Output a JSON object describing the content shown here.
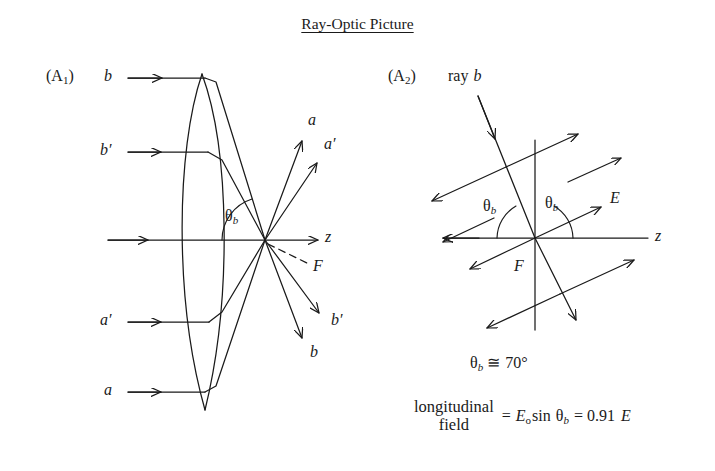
{
  "document": {
    "title": "Ray-Optic Picture",
    "background_color": "#ffffff",
    "ink_color": "#1a1a1a"
  },
  "panels": [
    {
      "tag": "(A",
      "tag_sub": "1",
      "tag_close": ")",
      "name": "lens-ray-diagram",
      "description": "Converging lens with parallel input rays focusing to a point",
      "incoming_rays": [
        {
          "label": "b",
          "y": 78
        },
        {
          "label": "b",
          "prime": "′",
          "y": 152
        },
        {
          "label": "",
          "y": 240
        },
        {
          "label": "a",
          "prime": "′",
          "y": 322
        },
        {
          "label": "a",
          "y": 392
        }
      ],
      "outgoing_rays": [
        {
          "label": "a",
          "direction": "up-right-steep"
        },
        {
          "label": "a′",
          "direction": "up-right-shallow"
        },
        {
          "label": "z",
          "direction": "right-axis"
        },
        {
          "label": "F",
          "direction": "down-right-dashed"
        },
        {
          "label": "b′",
          "direction": "down-right-shallow"
        },
        {
          "label": "b",
          "direction": "down-right-steep"
        }
      ],
      "angle_label": "θ",
      "angle_sub": "b",
      "axis_label": "z",
      "focal_label": "F"
    },
    {
      "tag": "(A",
      "tag_sub": "2",
      "tag_close": ")",
      "name": "field-vector-diagram",
      "description": "Ray b crossing the axis with transverse E field vectors",
      "ray_label_prefix": "ray",
      "ray_label": "b",
      "field_label": "E",
      "axis_label": "z",
      "focal_label": "F",
      "angle_label": "θ",
      "angle_sub": "b",
      "angle_count": 2
    }
  ],
  "captions": {
    "angle_value": {
      "symbol": "θ",
      "sub": "b",
      "relation": "≅",
      "value": "70°",
      "full": "θb ≅ 70°"
    },
    "equation": {
      "lhs_line1": "longitudinal",
      "lhs_line2": "field",
      "equals": "=",
      "term": "E",
      "term_sub": "o",
      "function": "sin",
      "angle": "θ",
      "angle_sub": "b",
      "equals2": "=",
      "result_value": "0.91",
      "result_unit": "E",
      "full": "longitudinal field = Eo sin θb = 0.91 E"
    }
  }
}
